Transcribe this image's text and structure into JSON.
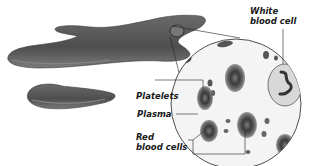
{
  "diagram": {
    "labels": {
      "white_blood_cell_line1": "White",
      "white_blood_cell_line2": "blood cell",
      "platelets": "Platelets",
      "plasma": "Plasma",
      "red_blood_cells_line1": "Red",
      "red_blood_cells_line2": "blood cells"
    },
    "colors": {
      "vessel": "#5a5a5a",
      "vessel_highlight": "#8a8a8a",
      "red_cell": "#555555",
      "line": "#333333",
      "background": "#ffffff"
    }
  }
}
